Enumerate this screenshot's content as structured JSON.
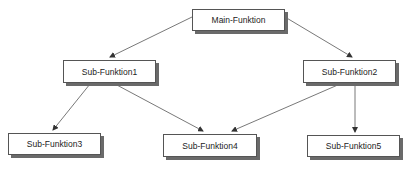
{
  "diagram": {
    "type": "hierarchy",
    "nodes": [
      {
        "id": "main",
        "label": "Main-Funktion",
        "x": 192,
        "y": 9,
        "w": 93,
        "h": 22
      },
      {
        "id": "sub1",
        "label": "Sub-Funktion1",
        "x": 63,
        "y": 60,
        "w": 93,
        "h": 23
      },
      {
        "id": "sub2",
        "label": "Sub-Funktion2",
        "x": 303,
        "y": 60,
        "w": 93,
        "h": 23
      },
      {
        "id": "sub3",
        "label": "Sub-Funktion3",
        "x": 8,
        "y": 133,
        "w": 93,
        "h": 22
      },
      {
        "id": "sub4",
        "label": "Sub-Funktion4",
        "x": 163,
        "y": 134,
        "w": 94,
        "h": 23
      },
      {
        "id": "sub5",
        "label": "Sub-Funktion5",
        "x": 307,
        "y": 135,
        "w": 93,
        "h": 22
      }
    ],
    "edges": [
      {
        "from": "main",
        "to": "sub1",
        "x1": 192,
        "y1": 17,
        "x2": 110,
        "y2": 57
      },
      {
        "from": "main",
        "to": "sub2",
        "x1": 285,
        "y1": 17,
        "x2": 352,
        "y2": 57
      },
      {
        "from": "sub1",
        "to": "sub3",
        "x1": 90,
        "y1": 84,
        "x2": 53,
        "y2": 130
      },
      {
        "from": "sub1",
        "to": "sub4",
        "x1": 115,
        "y1": 84,
        "x2": 203,
        "y2": 131
      },
      {
        "from": "sub2",
        "to": "sub4",
        "x1": 340,
        "y1": 84,
        "x2": 232,
        "y2": 131
      },
      {
        "from": "sub2",
        "to": "sub5",
        "x1": 355,
        "y1": 84,
        "x2": 355,
        "y2": 132
      }
    ],
    "colors": {
      "line": "#555555",
      "border": "#555555",
      "shadow": "#6a6a6a",
      "text": "#222222"
    }
  }
}
